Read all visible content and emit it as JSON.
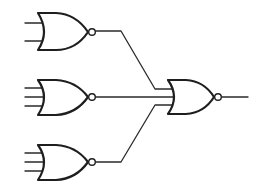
{
  "diagram": {
    "type": "logic-circuit",
    "colors": {
      "stroke": "#1e1e1e",
      "background": "#ffffff"
    },
    "gates": [
      {
        "id": "nor-1",
        "kind": "NOR",
        "inputs": 2,
        "position": "top-left"
      },
      {
        "id": "nor-2",
        "kind": "NOR",
        "inputs": 3,
        "position": "middle-left"
      },
      {
        "id": "nor-3",
        "kind": "NOR",
        "inputs": 3,
        "position": "bottom-left"
      },
      {
        "id": "nor-out",
        "kind": "NOR",
        "inputs": 3,
        "position": "right"
      }
    ],
    "connections": [
      {
        "from": "nor-1",
        "to": "nor-out",
        "input": 1
      },
      {
        "from": "nor-2",
        "to": "nor-out",
        "input": 2
      },
      {
        "from": "nor-3",
        "to": "nor-out",
        "input": 3
      }
    ]
  }
}
